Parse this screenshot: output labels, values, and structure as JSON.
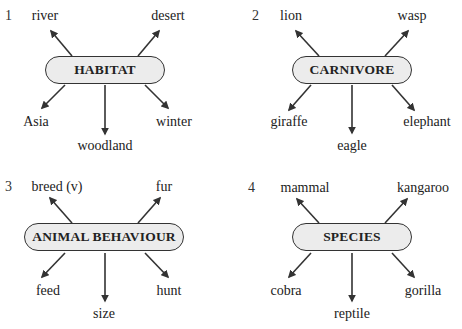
{
  "diagrams": [
    {
      "number": "1",
      "center": "HABITAT",
      "top_left": "river",
      "top_right": "desert",
      "bottom_left": "Asia",
      "bottom_center": "woodland",
      "bottom_right": "winter"
    },
    {
      "number": "2",
      "center": "CARNIVORE",
      "top_left": "lion",
      "top_right": "wasp",
      "bottom_left": "giraffe",
      "bottom_center": "eagle",
      "bottom_right": "elephant"
    },
    {
      "number": "3",
      "center": "ANIMAL BEHAVIOUR",
      "top_left": "breed (v)",
      "top_right": "fur",
      "bottom_left": "feed",
      "bottom_center": "size",
      "bottom_right": "hunt"
    },
    {
      "number": "4",
      "center": "SPECIES",
      "top_left": "mammal",
      "top_right": "kangaroo",
      "bottom_left": "cobra",
      "bottom_center": "reptile",
      "bottom_right": "gorilla"
    }
  ],
  "colors": {
    "pill_fill": "#ececec",
    "stroke": "#333333"
  }
}
